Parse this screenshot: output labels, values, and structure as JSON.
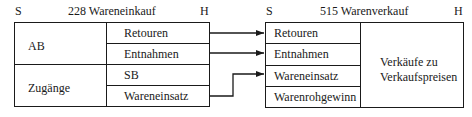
{
  "left_account": {
    "side_debit": "S",
    "side_credit": "H",
    "title": "228 Wareneinkauf",
    "debit_entries": [
      "AB",
      "Zugänge"
    ],
    "credit_entries": [
      "Retouren",
      "Entnahmen",
      "SB",
      "Wareneinsatz"
    ]
  },
  "right_account": {
    "side_debit": "S",
    "side_credit": "H",
    "title": "515 Warenverkauf",
    "debit_entries": [
      "Retouren",
      "Entnahmen",
      "Wareneinsatz",
      "Warenrohgewinn"
    ],
    "credit_entry_line1": "Verkäufe zu",
    "credit_entry_line2": "Verkaufspreisen"
  },
  "connectors": [
    {
      "from": "Retouren",
      "to": "Retouren"
    },
    {
      "from": "Entnahmen",
      "to": "Entnahmen"
    },
    {
      "from": "Wareneinsatz",
      "to": "Wareneinsatz"
    }
  ]
}
